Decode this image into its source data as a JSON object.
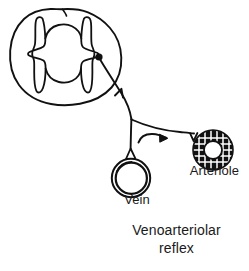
{
  "figure": {
    "name": "venoarteriolar-reflex-diagram",
    "caption_line_1": "Venoarteriolar",
    "caption_line_2": "reflex",
    "footnote_clipped": "",
    "stroke_color": "#111111",
    "background_color": "#ffffff"
  },
  "labels": {
    "vein": "Vein",
    "arteriole": "Arteriole"
  },
  "structures": {
    "spinal_cord": {
      "name": "spinal-cord-cross-section",
      "description": "Spinal cord transverse section with butterfly-shaped gray matter",
      "outline_color": "#111111"
    },
    "gray_matter": {
      "name": "gray-matter-butterfly",
      "description": "H-shaped central gray matter with dorsal and ventral horns"
    },
    "synapse_node": {
      "name": "synapse-dot",
      "description": "Filled black dot at the cord where the afferent fiber terminates",
      "color": "#111111",
      "x": 99,
      "y": 57,
      "radius": 3.4
    },
    "afferent_fiber": {
      "name": "afferent-nerve-fiber",
      "description": "Sensory fiber running from vein up to the spinal cord, arrowhead pointing toward cord"
    },
    "efferent_fiber": {
      "name": "efferent-nerve-fiber",
      "description": "Sympathetic fiber branching toward the arteriole"
    },
    "flow_arrow": {
      "name": "reflex-direction-arrow",
      "description": "Curved arrow indicating signal travel from vein branch toward the arteriole"
    },
    "vein": {
      "name": "vein-cross-section",
      "description": "Thin-walled vessel drawn as concentric thin circles",
      "cx": 131,
      "cy": 178,
      "r_outer": 19,
      "r_inner": 15.5
    },
    "arteriole": {
      "name": "arteriole-cross-section",
      "description": "Thick-walled vessel with radially hatched smooth muscle layer",
      "cx": 213,
      "cy": 150,
      "r_outer": 20,
      "r_inner": 9
    }
  },
  "colors": {
    "ink": "#111111",
    "text": "#1a1a1a",
    "paper": "#ffffff"
  }
}
